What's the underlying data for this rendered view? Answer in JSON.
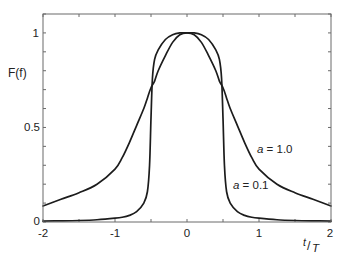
{
  "chart_data": {
    "type": "line",
    "title": "",
    "xlabel": "t/T",
    "xlabel_parts": {
      "num": "t",
      "slash": "/",
      "den": "T"
    },
    "ylabel": "F(f)",
    "xlim": [
      -2,
      2
    ],
    "ylim": [
      0,
      1.1
    ],
    "grid": false,
    "legend": "inline curve annotations",
    "xticks": [
      -2,
      -1,
      0,
      1,
      2
    ],
    "xtick_labels": [
      "-2",
      "-1",
      "0",
      "1",
      "2"
    ],
    "xminor_step": 0.5,
    "yticks": [
      0,
      0.5,
      1
    ],
    "ytick_labels": [
      "0",
      "0.5",
      "1"
    ],
    "yminor_step": 0.1,
    "x": [
      -2,
      -1.75,
      -1.5,
      -1.25,
      -1,
      -0.9,
      -0.8,
      -0.7,
      -0.6,
      -0.55,
      -0.52,
      -0.5,
      -0.48,
      -0.45,
      -0.4,
      -0.3,
      -0.2,
      -0.1,
      0,
      0.1,
      0.2,
      0.3,
      0.4,
      0.45,
      0.48,
      0.5,
      0.52,
      0.55,
      0.6,
      0.7,
      0.8,
      0.9,
      1,
      1.25,
      1.5,
      1.75,
      2
    ],
    "series": [
      {
        "name": "a = 1.0",
        "values": [
          0.085,
          0.12,
          0.155,
          0.2,
          0.28,
          0.34,
          0.42,
          0.51,
          0.6,
          0.655,
          0.69,
          0.71,
          0.725,
          0.745,
          0.8,
          0.88,
          0.95,
          0.99,
          1.0,
          0.99,
          0.95,
          0.88,
          0.8,
          0.745,
          0.725,
          0.71,
          0.69,
          0.655,
          0.6,
          0.51,
          0.42,
          0.34,
          0.28,
          0.2,
          0.155,
          0.12,
          0.085
        ]
      },
      {
        "name": "a = 0.1",
        "values": [
          0.005,
          0.006,
          0.008,
          0.012,
          0.02,
          0.025,
          0.035,
          0.055,
          0.1,
          0.16,
          0.3,
          0.55,
          0.76,
          0.86,
          0.91,
          0.965,
          0.99,
          1.0,
          1.0,
          1.0,
          0.99,
          0.965,
          0.91,
          0.86,
          0.76,
          0.55,
          0.3,
          0.16,
          0.1,
          0.055,
          0.035,
          0.025,
          0.02,
          0.012,
          0.008,
          0.006,
          0.005
        ]
      }
    ],
    "annotations": [
      {
        "text": "a = 1.0",
        "var": "a",
        "rest": " = 1.0",
        "x": 0.98,
        "y": 0.37
      },
      {
        "text": "a = 0.1",
        "var": "a",
        "rest": " = 0.1",
        "x": 0.64,
        "y": 0.18
      }
    ],
    "colors": {
      "curve": "#1c1c1c",
      "frame": "#6a6a6a",
      "text": "#222222",
      "background": "#ffffff"
    }
  }
}
